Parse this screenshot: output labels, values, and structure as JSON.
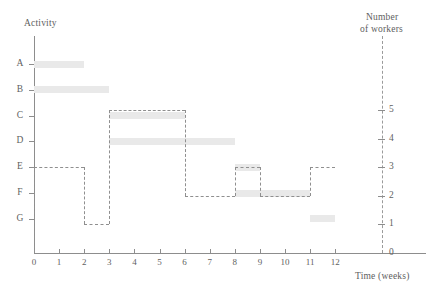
{
  "titles": {
    "activity_axis": "Activity",
    "workers_axis_line1": "Number",
    "workers_axis_line2": "of workers",
    "time_axis": "Time (weeks)"
  },
  "axes": {
    "x_ticks": [
      "0",
      "1",
      "2",
      "3",
      "4",
      "5",
      "6",
      "7",
      "8",
      "9",
      "10",
      "11",
      "12"
    ],
    "activity_labels": [
      "A",
      "B",
      "C",
      "D",
      "E",
      "F",
      "G"
    ],
    "worker_ticks": [
      "0",
      "1",
      "2",
      "3",
      "4",
      "5"
    ]
  },
  "colors": {
    "bar_fill": "#e9e9e9",
    "axis": "#8d8d8d",
    "dashed_line": "#8f8f8f",
    "text": "#5f5f5f",
    "background": "#ffffff"
  },
  "chart_data": {
    "type": "bar",
    "title": "",
    "subtitle": "",
    "xlabel": "Time (weeks)",
    "ylabel": "Activity",
    "y2label": "Number of workers",
    "xlim": [
      0,
      12
    ],
    "ylim": [
      0,
      5
    ],
    "grid": false,
    "legend": "none",
    "categories": [
      "A",
      "B",
      "C",
      "D",
      "E",
      "F",
      "G"
    ],
    "tasks": [
      {
        "activity": "A",
        "start": 0,
        "end": 2,
        "duration": 2
      },
      {
        "activity": "B",
        "start": 0,
        "end": 3,
        "duration": 3
      },
      {
        "activity": "C",
        "start": 3,
        "end": 6,
        "duration": 3
      },
      {
        "activity": "D",
        "start": 3,
        "end": 8,
        "duration": 5
      },
      {
        "activity": "E",
        "start": 8,
        "end": 9,
        "duration": 1
      },
      {
        "activity": "F",
        "start": 8,
        "end": 11,
        "duration": 3
      },
      {
        "activity": "G",
        "start": 11,
        "end": 12,
        "duration": 1
      }
    ],
    "worker_histogram": {
      "series_name": "Number of workers",
      "style": "dashed step",
      "steps": [
        {
          "start": 0,
          "end": 2,
          "workers": 3
        },
        {
          "start": 2,
          "end": 3,
          "workers": 1
        },
        {
          "start": 3,
          "end": 6,
          "workers": 5
        },
        {
          "start": 6,
          "end": 8,
          "workers": 2
        },
        {
          "start": 8,
          "end": 9,
          "workers": 3
        },
        {
          "start": 9,
          "end": 11,
          "workers": 2
        },
        {
          "start": 11,
          "end": 12,
          "workers": 3
        }
      ]
    }
  }
}
